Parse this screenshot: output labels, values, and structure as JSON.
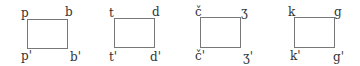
{
  "diagrams": [
    {
      "tl": "p",
      "tr": "b",
      "bl": "p'",
      "br": "b'"
    },
    {
      "tl": "t",
      "tr": "d",
      "bl": "t'",
      "br": "d'"
    },
    {
      "tl": "č",
      "tr": "ʒ",
      "bl": "č'",
      "br": "ʒ'"
    },
    {
      "tl": "k",
      "tr": "g",
      "bl": "k'",
      "br": "g'"
    }
  ]
}
